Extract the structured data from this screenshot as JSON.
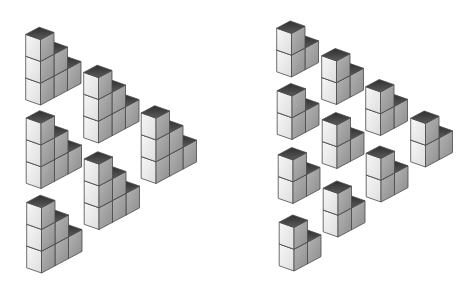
{
  "canvas": {
    "width": 474,
    "height": 286,
    "background": "#ffffff"
  },
  "colors": {
    "top_dark": "#2f2f2f",
    "top_light": "#5a5a5a",
    "left_light": "#f7f7f7",
    "left_dark": "#dedede",
    "right_light": "#b4b4b4",
    "right_dark": "#8e8e8e",
    "edge": "#4a4a4a"
  },
  "cube_vectors": {
    "left": [
      -14.8,
      -5.2
    ],
    "right": [
      13.5,
      -7.2
    ],
    "up": [
      0,
      -21.8
    ]
  },
  "figures": [
    {
      "name": "left-figure",
      "description": "Triangle arrangement of 6 staircase blocks, each with column heights 3,2,1",
      "clusters": [
        {
          "id": "A",
          "anchor": [
            40.5,
            105
          ],
          "columns": [
            3,
            2,
            1
          ]
        },
        {
          "id": "B",
          "anchor": [
            98.5,
            143
          ],
          "columns": [
            3,
            2,
            1
          ]
        },
        {
          "id": "C",
          "anchor": [
            41,
            188.5
          ],
          "columns": [
            3,
            2,
            1
          ]
        },
        {
          "id": "D",
          "anchor": [
            156,
            183.5
          ],
          "columns": [
            3,
            2,
            1
          ]
        },
        {
          "id": "E",
          "anchor": [
            99,
            229.5
          ],
          "columns": [
            3,
            2,
            1
          ]
        },
        {
          "id": "F",
          "anchor": [
            41.5,
            273
          ],
          "columns": [
            3,
            2,
            1
          ]
        }
      ]
    },
    {
      "name": "right-figure",
      "description": "Triangle arrangement of 10 staircase blocks, each with column heights 2,1",
      "clusters": [
        {
          "id": "R1",
          "anchor": [
            291.5,
            77
          ],
          "columns": [
            2,
            1
          ]
        },
        {
          "id": "R2",
          "anchor": [
            336.5,
            104.5
          ],
          "columns": [
            2,
            1
          ]
        },
        {
          "id": "R3",
          "anchor": [
            292,
            139.5
          ],
          "columns": [
            2,
            1
          ]
        },
        {
          "id": "R4",
          "anchor": [
            380.5,
            135.5
          ],
          "columns": [
            2,
            1
          ]
        },
        {
          "id": "R5",
          "anchor": [
            337,
            168.5
          ],
          "columns": [
            2,
            1
          ]
        },
        {
          "id": "R6",
          "anchor": [
            425.5,
            167
          ],
          "columns": [
            2,
            1
          ]
        },
        {
          "id": "R7",
          "anchor": [
            293,
            203.5
          ],
          "columns": [
            2,
            1
          ]
        },
        {
          "id": "R8",
          "anchor": [
            381,
            202
          ],
          "columns": [
            2,
            1
          ]
        },
        {
          "id": "R9",
          "anchor": [
            338,
            237
          ],
          "columns": [
            2,
            1
          ]
        },
        {
          "id": "R10",
          "anchor": [
            294,
            271
          ],
          "columns": [
            2,
            1
          ]
        }
      ]
    }
  ]
}
